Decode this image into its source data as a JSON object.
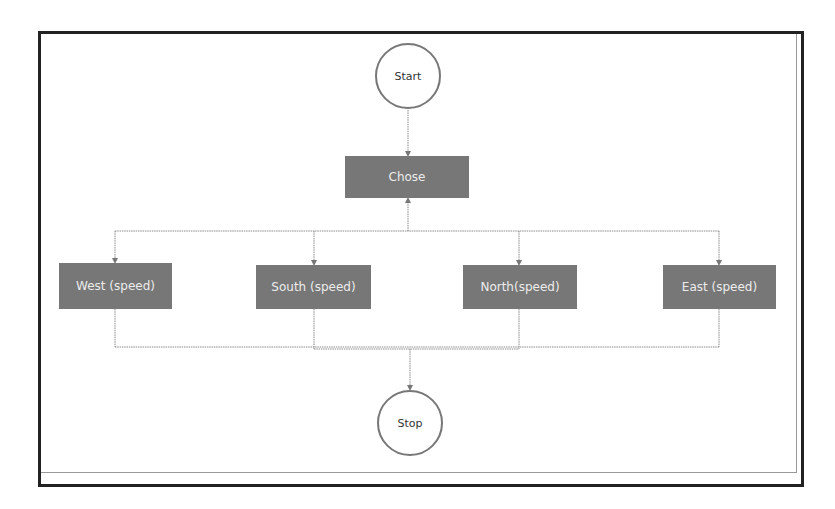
{
  "diagram": {
    "type": "flowchart",
    "colors": {
      "frame": "#222222",
      "box_fill": "#777777",
      "box_text": "#ececec",
      "circle_border": "#777777",
      "connector": "#8a8a8a"
    },
    "nodes": {
      "start": {
        "label": "Start",
        "shape": "circle"
      },
      "chose": {
        "label": "Chose",
        "shape": "rectangle"
      },
      "west": {
        "label": "West (speed)",
        "shape": "rectangle"
      },
      "south": {
        "label": "South (speed)",
        "shape": "rectangle"
      },
      "north": {
        "label": "North(speed)",
        "shape": "rectangle"
      },
      "east": {
        "label": "East (speed)",
        "shape": "rectangle"
      },
      "stop": {
        "label": "Stop",
        "shape": "circle"
      }
    },
    "edges": [
      {
        "from": "start",
        "to": "chose"
      },
      {
        "from": "chose",
        "to": "west"
      },
      {
        "from": "chose",
        "to": "south"
      },
      {
        "from": "chose",
        "to": "north"
      },
      {
        "from": "chose",
        "to": "east"
      },
      {
        "from": "west",
        "to": "stop"
      },
      {
        "from": "south",
        "to": "stop"
      },
      {
        "from": "north",
        "to": "stop"
      },
      {
        "from": "east",
        "to": "stop"
      }
    ]
  }
}
